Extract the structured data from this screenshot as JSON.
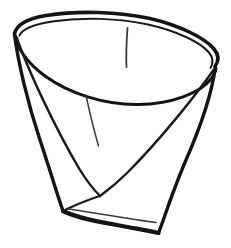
{
  "figure": {
    "title": "Folded paper cup",
    "style": "hand-drawn ink contour line art",
    "background_color": "#ffffff",
    "ink_color": "#141414",
    "crease_color": "#3a3a3a",
    "paper_color": "#ffffff",
    "canvas": {
      "width": 231,
      "height": 248
    },
    "strokes": {
      "rim_outer": {
        "name": "outer rim lip",
        "width": 3.6,
        "path": "M 14.5 33.5 C 17 23.5 28 18.5 46 15.5 C 78 10.5 118 11.5 150 18.5 C 180 25.5 205 38 214 49 C 219.5 55.5 219 61 215 66.5"
      },
      "rim_inner_front": {
        "name": "inner rim front curve",
        "width": 3.0,
        "path": "M 14.8 34.5 C 16 46 26 62 45 76 C 70 94 105 105 138 104.5 C 172 104 200 93 211 79 C 216 72 216.5 68 215.3 66.8"
      },
      "rim_inner_back": {
        "name": "inner rim lip underline",
        "width": 2.0,
        "path": "M 19.5 35.5 C 22 29 34 24.5 52 21.5 C 82 17 118 18 148 24.5 C 177 31 200 42 209 52.5 C 213.5 58 213.5 63 210.5 68"
      },
      "body_left": {
        "name": "left body edge",
        "width": 3.4,
        "path": "M 14.5 34.5 C 18 62 28 104 40 140 C 50 170 57 194 63 211"
      },
      "body_right": {
        "name": "right body edge",
        "width": 3.4,
        "path": "M 215.3 67 C 212 93 200 128 186 160 C 173 190 164 219 158.5 233"
      },
      "bottom_edge": {
        "name": "bottom folded base edge",
        "width": 4.2,
        "path": "M 63 211 C 77 218 100 222 122 226 C 138 229 150 231 158.5 233"
      },
      "fold_left_diagonal": {
        "name": "left diagonal fold to center V",
        "width": 2.4,
        "path": "M 16.5 37 C 28 70 55 128 80 170 C 90 186 97 193 100 196"
      },
      "fold_right_diagonal": {
        "name": "right diagonal fold to center V",
        "width": 2.4,
        "path": "M 213.5 70 C 196 95 160 140 128 172 C 113 187 104 193 100 196"
      },
      "fold_v_left_leg": {
        "name": "lower left V fold leg",
        "width": 2.2,
        "path": "M 100 196 C 90 199 78 204 68 208.5 C 65.5 209.8 64 210.5 63 211"
      },
      "fold_inner_base": {
        "name": "inner base seam line",
        "width": 1.6,
        "path": "M 69 209 C 88 212 112 216 132 219 C 144 221 152 222 156 222.5"
      },
      "crease_center": {
        "name": "interior vertical crease",
        "width": 1.5,
        "path": "M 86 95 C 89 110 94 130 98.5 146"
      },
      "crease_rim_top": {
        "name": "short crease on far rim wall",
        "width": 1.8,
        "path": "M 127.5 28 C 126.5 42 126 56 126.5 67"
      }
    }
  }
}
